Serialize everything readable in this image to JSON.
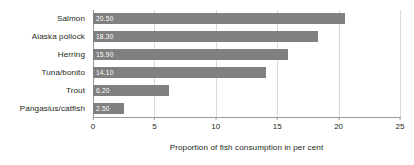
{
  "chart_data": {
    "type": "bar",
    "orientation": "horizontal",
    "title": "",
    "subtitle": "",
    "xlabel": "Proportion of fish consumption in per cent",
    "ylabel": "",
    "categories": [
      "Salmon",
      "Alaska pollock",
      "Herring",
      "Tuna/bonito",
      "Trout",
      "Pangasius/catfish"
    ],
    "values": [
      20.5,
      18.3,
      15.9,
      14.1,
      6.2,
      2.5
    ],
    "value_labels": [
      "20.50",
      "18.30",
      "15.90",
      "14.10",
      "6.20",
      "2.50"
    ],
    "xlim": [
      0,
      25
    ],
    "xticks": [
      0,
      5,
      10,
      15,
      20,
      25
    ],
    "xtick_labels": [
      "0",
      "5",
      "10",
      "15",
      "20",
      "25"
    ],
    "grid": "vertical",
    "legend": "none",
    "bar_color": "#808080",
    "value_label_color": "#ffffff",
    "gridline_color": "#d9d9d9",
    "axis_color": "#9a9a9a",
    "text_color": "#231f20"
  }
}
